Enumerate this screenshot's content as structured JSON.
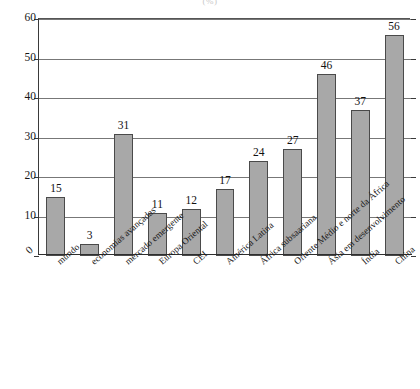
{
  "chart_data": {
    "type": "bar",
    "title": "",
    "unit_note": "(%)",
    "xlabel": "",
    "ylabel": "",
    "ylim": [
      0,
      60
    ],
    "ytick_values": [
      0,
      10,
      20,
      30,
      40,
      50,
      60
    ],
    "ytick_labels": [
      "0",
      "10",
      "20",
      "30",
      "40",
      "50",
      "60"
    ],
    "grid": "horizontal",
    "legend": "none",
    "categories": [
      "mundo",
      "economias avançadas",
      "mercado emergente",
      "Europa Oriental",
      "CEI",
      "América Latina",
      "África subsaariana",
      "Oriente Médio e norte da África",
      "Ásia em desenvolvimento",
      "Índia",
      "China"
    ],
    "values": [
      15,
      3,
      31,
      11,
      12,
      17,
      24,
      27,
      46,
      37,
      56
    ],
    "value_labels": [
      "15",
      "3",
      "31",
      "11",
      "12",
      "17",
      "24",
      "27",
      "46",
      "37",
      "56"
    ],
    "bar_color": "#a8a8a8",
    "bar_edge_color": "#4a4a4a",
    "axis_color": "#2e2e2e",
    "grid_color": "#777777"
  }
}
